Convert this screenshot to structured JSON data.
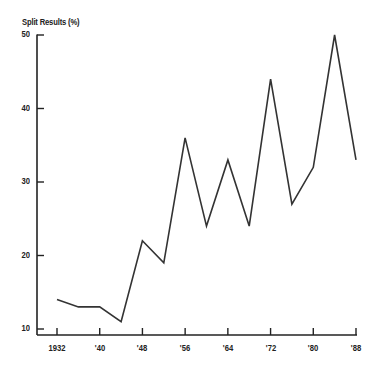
{
  "chart_data": {
    "type": "line",
    "title": "Split Results (%)",
    "xlabel": "",
    "ylabel": "Split Results (%)",
    "x": [
      1932,
      1936,
      1940,
      1944,
      1948,
      1952,
      1956,
      1960,
      1964,
      1968,
      1972,
      1976,
      1980,
      1984,
      1988
    ],
    "series": [
      {
        "name": "Split Results",
        "values": [
          14,
          13,
          13,
          11,
          22,
          19,
          36,
          24,
          33,
          24,
          44,
          27,
          32,
          50,
          33
        ]
      }
    ],
    "xticks": [
      1932,
      1940,
      1948,
      1956,
      1964,
      1972,
      1980,
      1988
    ],
    "xtick_labels": [
      "1932",
      "'40",
      "'48",
      "'56",
      "'64",
      "'72",
      "'80",
      "'88"
    ],
    "yticks": [
      10,
      20,
      30,
      40,
      50
    ],
    "ytick_labels": [
      "10",
      "20",
      "30",
      "40",
      "50"
    ],
    "ylim": [
      10,
      50
    ],
    "xlim": [
      1932,
      1988
    ],
    "grid": false,
    "legend": "none",
    "line_color": "#333333"
  }
}
